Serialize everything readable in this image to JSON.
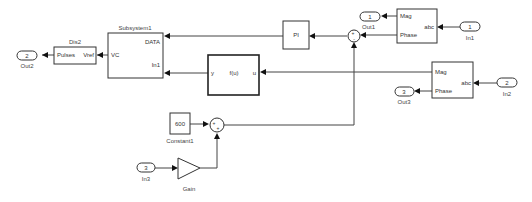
{
  "diagram": {
    "blocks": {
      "out2": {
        "number": "2",
        "label": "Out2"
      },
      "dis2": {
        "title": "Dis2",
        "port_in": "Vref",
        "body": "Pulses"
      },
      "subsystem1": {
        "title": "Subsystem1",
        "port_out": "VC",
        "port_in1": "DATA",
        "port_in2": "In1"
      },
      "pi": {
        "label": "PI"
      },
      "fcn": {
        "port_out": "y",
        "body": "f(u)",
        "port_in": "u"
      },
      "sum1": {
        "label": "Out1",
        "signs": "+ -"
      },
      "out1": {
        "number": "1",
        "label": "Out1"
      },
      "conv1": {
        "port_mag": "Mag",
        "port_phase": "Phase",
        "port_abc": "abc"
      },
      "in1": {
        "number": "1",
        "label": "In1"
      },
      "conv2": {
        "port_mag": "Mag",
        "port_phase": "Phase",
        "port_abc": "abc"
      },
      "in2": {
        "number": "2",
        "label": "In2"
      },
      "out3": {
        "number": "3",
        "label": "Out3"
      },
      "constant1": {
        "value": "600",
        "label": "Constant1"
      },
      "sum2": {
        "signs": "+ +"
      },
      "in3": {
        "number": "3",
        "label": "In3"
      },
      "gain": {
        "label": "Gain"
      }
    }
  }
}
